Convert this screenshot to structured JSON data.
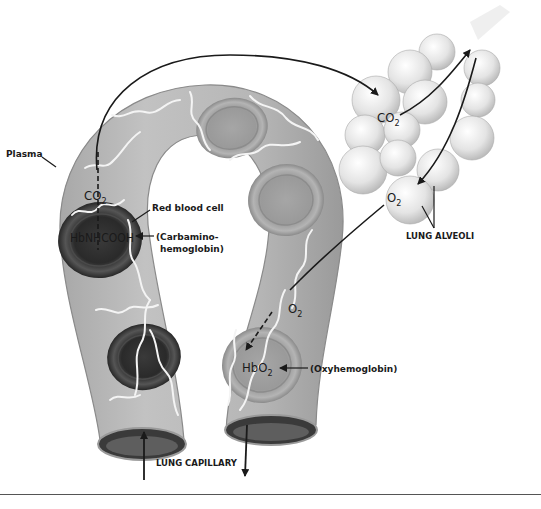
{
  "diagram": {
    "labels": {
      "plasma": "Plasma",
      "red_blood_cell": "Red blood cell",
      "carbamino_line1": "(Carbamino-",
      "carbamino_line2": "hemoglobin)",
      "oxyhemoglobin": "(Oxyhemoglobin)",
      "lung_alveoli": "LUNG ALVEOLI",
      "lung_capillary": "LUNG CAPILLARY"
    },
    "chemicals": {
      "co2_plasma": {
        "base": "CO",
        "sub": "2"
      },
      "co2_alveoli": {
        "base": "CO",
        "sub": "2"
      },
      "o2_alveoli": {
        "base": "O",
        "sub": "2"
      },
      "o2_capillary": {
        "base": "O",
        "sub": "2"
      },
      "hbnhcooh": "HbNHCOOH",
      "hbo2": {
        "base": "HbO",
        "sub": "2"
      }
    },
    "colors": {
      "capillary_fill": "#b8b8b8",
      "capillary_dark": "#8e8e8e",
      "rbc_dark": "#2e2e2e",
      "rbc_light": "#8a8a8a",
      "alveoli_fill": "#e6e6e6",
      "ink": "#1a1a1a"
    }
  }
}
